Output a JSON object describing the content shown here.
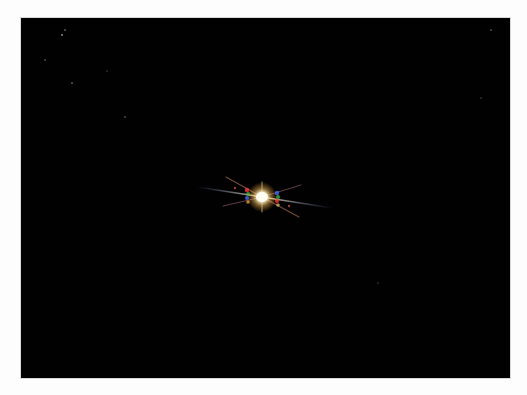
{
  "image": {
    "subject": "bright star with diffraction spikes",
    "background_color": "#010101",
    "frame_color": "#fdfdfd",
    "star": {
      "center_x": 241,
      "center_y": 179,
      "core_color": "#fffbe8",
      "halo_color": "#ffd27a",
      "spike_colors": [
        "#ff3b2f",
        "#3fbf4a",
        "#3f6bff",
        "#ffe27a"
      ]
    },
    "faint_stars": [
      {
        "x": 44,
        "y": 12
      },
      {
        "x": 41,
        "y": 17
      },
      {
        "x": 24,
        "y": 42
      },
      {
        "x": 51,
        "y": 65
      },
      {
        "x": 104,
        "y": 99
      },
      {
        "x": 86,
        "y": 53
      },
      {
        "x": 470,
        "y": 12
      },
      {
        "x": 460,
        "y": 80
      },
      {
        "x": 357,
        "y": 265
      }
    ]
  },
  "caption": {
    "text": ""
  }
}
